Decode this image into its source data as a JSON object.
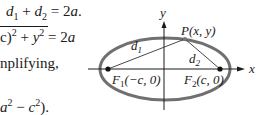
{
  "text": {
    "line1": {
      "d1": "d",
      "d1_sub": "1",
      "plus": " + ",
      "d2": "d",
      "d2_sub": "2",
      "eq": " = 2",
      "a": "a",
      "end": "."
    },
    "line2": {
      "pre": "c)",
      "sup1": "2",
      "plus": " + ",
      "y": "y",
      "sup2": "2",
      "eq": " = 2",
      "a": "a"
    },
    "line3": {
      "text": "nplifying,"
    },
    "line4": {
      "pre": "a",
      "sup1": "2",
      "minus": " − ",
      "c": "c",
      "sup2": "2",
      "end": ")."
    }
  },
  "diagram": {
    "axis_x_label": "x",
    "axis_y_label": "y",
    "point_label": "P(x, y)",
    "d1_label": "d",
    "d1_sub": "1",
    "d2_label": "d",
    "d2_sub": "2",
    "focus1_label": "F",
    "focus1_sub": "1",
    "focus1_coords": "(−c, 0)",
    "focus2_label": "F",
    "focus2_sub": "2",
    "focus2_coords": "(c, 0)",
    "colors": {
      "ellipse": "#707070",
      "axes": "#1a1a1a",
      "lines": "#333333"
    }
  }
}
